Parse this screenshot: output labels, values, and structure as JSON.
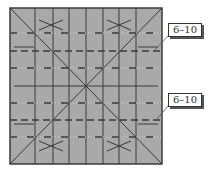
{
  "diagram": {
    "paper": {
      "x": 10,
      "y": 8,
      "w": 152,
      "h": 156,
      "fill": "#a9a9a9",
      "stroke": "#3c3c3c"
    },
    "line_color": "#3a3a3a",
    "dot_color": "#d0d0d0",
    "vertical_creases_x": [
      35,
      53,
      69,
      86,
      103,
      119,
      136
    ],
    "center_horizontal_y": 86,
    "dash_dot_rows_y": [
      33,
      68,
      103,
      137
    ],
    "dashed_rows_y": [
      51,
      120
    ],
    "diagonals": [
      {
        "x1": 10,
        "y1": 8,
        "x2": 162,
        "y2": 164
      },
      {
        "x1": 162,
        "y1": 8,
        "x2": 10,
        "y2": 164
      }
    ],
    "side_marks": [
      {
        "x1": 14,
        "y1": 47,
        "x2": 34,
        "y2": 47
      },
      {
        "x1": 138,
        "y1": 47,
        "x2": 158,
        "y2": 47
      },
      {
        "x1": 14,
        "y1": 124,
        "x2": 34,
        "y2": 124
      },
      {
        "x1": 138,
        "y1": 124,
        "x2": 158,
        "y2": 124
      }
    ],
    "x_marks": [
      {
        "cx": 51,
        "cy": 25
      },
      {
        "cx": 119,
        "cy": 25
      },
      {
        "cx": 51,
        "cy": 146
      },
      {
        "cx": 119,
        "cy": 146
      }
    ],
    "labels": [
      {
        "text": "6–10",
        "box_x": 168,
        "box_y": 23,
        "leader_x1": 168,
        "leader_y1": 36,
        "leader_x2": 155,
        "leader_y2": 50
      },
      {
        "text": "6–10",
        "box_x": 168,
        "box_y": 93,
        "leader_x1": 168,
        "leader_y1": 106,
        "leader_x2": 156,
        "leader_y2": 120
      }
    ]
  }
}
